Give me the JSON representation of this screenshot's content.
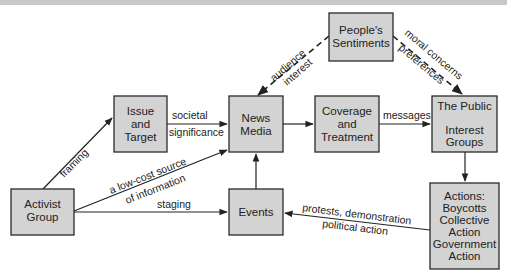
{
  "diagram": {
    "header_band_color": "#c9c9c9",
    "box_fill": "#d3d3d3",
    "nodes": [
      {
        "id": "activist",
        "lines": [
          "Activist",
          "Group"
        ]
      },
      {
        "id": "issue",
        "lines": [
          "Issue",
          "and",
          "Target"
        ]
      },
      {
        "id": "news",
        "lines": [
          "News",
          "Media"
        ]
      },
      {
        "id": "coverage",
        "lines": [
          "Coverage",
          "and",
          "Treatment"
        ]
      },
      {
        "id": "public",
        "lines": [
          "The Public",
          "",
          "Interest",
          "Groups"
        ]
      },
      {
        "id": "sentiments",
        "lines": [
          "People's",
          "Sentiments"
        ]
      },
      {
        "id": "events",
        "lines": [
          "Events"
        ]
      },
      {
        "id": "actions",
        "lines": [
          "Actions:",
          "Boycotts",
          "Collective",
          "Action",
          "Government",
          "Action"
        ]
      }
    ],
    "edges": [
      {
        "from": "activist",
        "to": "issue",
        "label": [
          "framing"
        ],
        "style": "solid"
      },
      {
        "from": "issue",
        "to": "news",
        "label": [
          "societal",
          "significance"
        ],
        "style": "solid"
      },
      {
        "from": "activist",
        "to": "news",
        "label": [
          "a low-cost source",
          "of information"
        ],
        "style": "solid"
      },
      {
        "from": "activist",
        "to": "events",
        "label": [
          "staging"
        ],
        "style": "solid"
      },
      {
        "from": "events",
        "to": "news",
        "label": [],
        "style": "solid"
      },
      {
        "from": "news",
        "to": "coverage",
        "label": [],
        "style": "solid"
      },
      {
        "from": "coverage",
        "to": "public",
        "label": [
          "messages"
        ],
        "style": "solid"
      },
      {
        "from": "sentiments",
        "to": "news",
        "label": [
          "audience",
          "interest"
        ],
        "style": "dashed"
      },
      {
        "from": "sentiments",
        "to": "public",
        "label": [
          "moral concerns",
          "preferences"
        ],
        "style": "dashed"
      },
      {
        "from": "public",
        "to": "actions",
        "label": [],
        "style": "solid"
      },
      {
        "from": "actions",
        "to": "events",
        "label": [
          "protests, demonstration",
          "political action"
        ],
        "style": "solid"
      }
    ]
  }
}
